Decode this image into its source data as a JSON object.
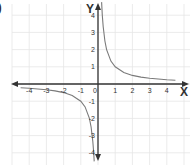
{
  "figure_label": ")",
  "chart_data": {
    "type": "line",
    "title": "",
    "function": "y = 1/x",
    "xlabel": "X",
    "ylabel": "Y",
    "xlim": [
      -4.7,
      5
    ],
    "ylim": [
      -4.5,
      4.8
    ],
    "grid": true,
    "x_ticks": [
      -4,
      -3,
      -2,
      -1,
      0,
      1,
      2,
      3,
      4
    ],
    "x_tick_labels": [
      "-4",
      "-3",
      "-2",
      "-1",
      "0",
      "1",
      "2",
      "3",
      "4"
    ],
    "y_ticks": [
      4,
      3,
      2,
      1,
      -1,
      -2,
      -3,
      -4
    ],
    "y_tick_labels": [
      "4",
      "3",
      "2",
      "1",
      "-1",
      "-2",
      "-3",
      "-4"
    ],
    "series": [
      {
        "name": "branch-positive",
        "x": [
          0.21,
          0.25,
          0.3,
          0.4,
          0.5,
          0.75,
          1,
          1.5,
          2,
          2.5,
          3,
          3.5,
          4,
          4.5
        ],
        "y": [
          4.76,
          4.0,
          3.33,
          2.5,
          2.0,
          1.33,
          1.0,
          0.67,
          0.5,
          0.4,
          0.33,
          0.29,
          0.25,
          0.22
        ]
      },
      {
        "name": "branch-negative",
        "x": [
          -4.5,
          -4,
          -3.5,
          -3,
          -2.5,
          -2,
          -1.5,
          -1,
          -0.75,
          -0.5,
          -0.4,
          -0.3,
          -0.25,
          -0.22
        ],
        "y": [
          -0.22,
          -0.25,
          -0.29,
          -0.33,
          -0.4,
          -0.5,
          -0.67,
          -1.0,
          -1.33,
          -2.0,
          -2.5,
          -3.33,
          -4.0,
          -4.5
        ]
      }
    ],
    "colors": {
      "curve": "#7a7a7a",
      "axis": "#333333",
      "grid": "#e6e6e6",
      "text": "#333333"
    }
  }
}
